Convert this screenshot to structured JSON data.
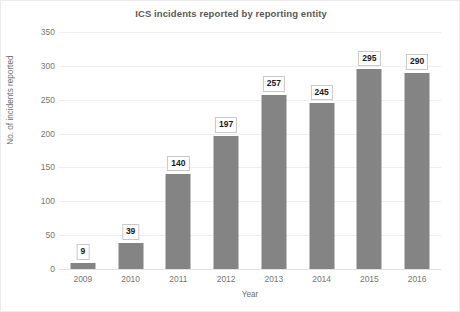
{
  "chart_data": {
    "type": "bar",
    "title": "ICS incidents reported by reporting entity",
    "xlabel": "Year",
    "ylabel": "No. of incidents reported",
    "categories": [
      "2009",
      "2010",
      "2011",
      "2012",
      "2013",
      "2014",
      "2015",
      "2016"
    ],
    "values": [
      9,
      39,
      140,
      197,
      257,
      245,
      295,
      290
    ],
    "data_labels": [
      "9",
      "39",
      "140",
      "197",
      "257",
      "245",
      "295",
      "290"
    ],
    "ylim": [
      0,
      350
    ],
    "yticks": [
      0,
      50,
      100,
      150,
      200,
      250,
      300,
      350
    ],
    "ytick_labels": [
      "0",
      "50",
      "100",
      "150",
      "200",
      "250",
      "300",
      "350"
    ],
    "grid": "horizontal",
    "legend": "none",
    "series_color": "#848484",
    "label_box_fill": "#ffffff",
    "label_box_border": "#c9c9c9",
    "gridline_color": "#eeeeee",
    "title_color": "#595959",
    "tick_color": "#767676"
  }
}
